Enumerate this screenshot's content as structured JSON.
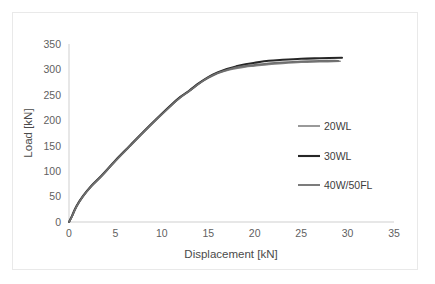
{
  "chart_data": {
    "type": "line",
    "title": "",
    "xlabel": "Displacement [kN]",
    "ylabel": "Load [kN]",
    "xlim": [
      0,
      35
    ],
    "ylim": [
      0,
      350
    ],
    "xticks": [
      0,
      5,
      10,
      15,
      20,
      25,
      30,
      35
    ],
    "yticks": [
      0,
      50,
      100,
      150,
      200,
      250,
      300,
      350
    ],
    "grid": false,
    "legend_position": "center-right",
    "series": [
      {
        "name": "20WL",
        "color": "#808080",
        "width": 1.6,
        "x": [
          0,
          0.3,
          0.8,
          1.5,
          2.4,
          3.5,
          5.0,
          6.5,
          8.0,
          9.5,
          11.0,
          12.0,
          13.0,
          14.0,
          15.0,
          16.0,
          17.0,
          18.0,
          19.0,
          20.0,
          21.5,
          23.0,
          25.0,
          27.0,
          29.2
        ],
        "y": [
          0,
          10,
          30,
          50,
          70,
          90,
          120,
          148,
          176,
          203,
          229,
          245,
          258,
          272,
          283,
          292,
          298,
          302,
          305,
          307,
          310,
          312,
          314,
          315,
          316
        ]
      },
      {
        "name": "30WL",
        "color": "#262626",
        "width": 2.1,
        "x": [
          0,
          0.3,
          0.8,
          1.5,
          2.4,
          3.5,
          5.0,
          6.5,
          8.0,
          9.5,
          11.0,
          12.0,
          13.0,
          14.0,
          15.0,
          16.0,
          17.0,
          18.0,
          19.0,
          20.0,
          21.5,
          23.0,
          25.0,
          27.0,
          29.4
        ],
        "y": [
          0,
          11,
          31,
          51,
          71,
          91,
          121,
          149,
          177,
          204,
          230,
          246,
          259,
          273,
          285,
          294,
          301,
          306,
          310,
          313,
          317,
          319,
          321,
          322,
          323
        ]
      },
      {
        "name": "40W/50FL",
        "color": "#6e6e6e",
        "width": 1.8,
        "x": [
          0,
          0.3,
          0.8,
          1.5,
          2.4,
          3.5,
          5.0,
          6.5,
          8.0,
          9.5,
          11.0,
          12.0,
          13.0,
          14.0,
          15.0,
          16.0,
          17.0,
          18.0,
          19.0,
          20.0,
          21.5,
          23.0,
          25.0,
          27.0,
          29.0
        ],
        "y": [
          0,
          10,
          30,
          50,
          70,
          90,
          120,
          148,
          176,
          203,
          229,
          245,
          258,
          272,
          284,
          293,
          299,
          304,
          307,
          309,
          312,
          314,
          316,
          317,
          317
        ]
      }
    ]
  },
  "axes": {
    "axis_line_color": "#cfcfcf",
    "tick_label_color": "#5f5f5f",
    "frame_color": "#e9e9e9"
  },
  "legend": {
    "items": [
      {
        "label": "20WL"
      },
      {
        "label": "30WL"
      },
      {
        "label": "40W/50FL"
      }
    ]
  }
}
